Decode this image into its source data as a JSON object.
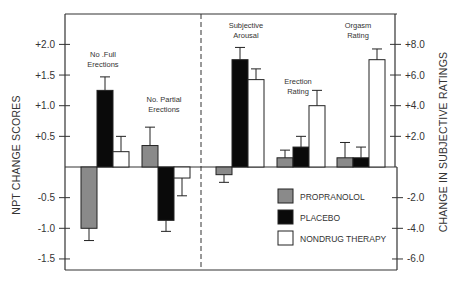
{
  "chart_data": {
    "type": "bar",
    "title": "",
    "left_axis": {
      "label": "NPT CHANGE SCORES",
      "ticks": [
        "+2.0",
        "+1.5",
        "+1.0",
        "+0.5",
        "-0.5",
        "-1.0",
        "-1.5"
      ],
      "tick_values": [
        2.0,
        1.5,
        1.0,
        0.5,
        -0.5,
        -1.0,
        -1.5
      ],
      "ylim": [
        -1.75,
        2.4
      ]
    },
    "right_axis": {
      "label": "CHANGE IN SUBJECTIVE RATINGS",
      "ticks": [
        "+8.0",
        "+6.0",
        "+4.0",
        "+2.0",
        "-2.0",
        "-4.0",
        "-6.0"
      ],
      "tick_values": [
        8.0,
        6.0,
        4.0,
        2.0,
        -2.0,
        -4.0,
        -6.0
      ],
      "ylim": [
        -7.0,
        9.6
      ]
    },
    "categories": [
      "No. Full Erections",
      "No. Partial Erections",
      "Subjective Arousal",
      "Erection Rating",
      "Orgasm Rating"
    ],
    "category_labels": [
      [
        "No .Full",
        "Erections"
      ],
      [
        "No. Partial",
        "Erections"
      ],
      [
        "Subjective",
        "Arousal"
      ],
      [
        "Erection",
        "Rating"
      ],
      [
        "Orgasm",
        "Rating"
      ]
    ],
    "category_axis": [
      "left",
      "left",
      "right",
      "right",
      "right"
    ],
    "series": [
      {
        "name": "PROPRANOLOL",
        "color": "#8a8a8a",
        "values": [
          -1.0,
          0.35,
          -0.5,
          0.6,
          0.6
        ],
        "errors": [
          -1.2,
          0.65,
          -1.0,
          1.1,
          1.6
        ]
      },
      {
        "name": "PLACEBO",
        "color": "#0a0a0a",
        "values": [
          1.25,
          -0.87,
          7.0,
          1.3,
          0.6
        ],
        "errors": [
          1.47,
          -1.05,
          7.8,
          2.0,
          1.3
        ]
      },
      {
        "name": "NONDRUG THERAPY",
        "color": "#ffffff",
        "values": [
          0.25,
          -0.18,
          5.7,
          4.0,
          7.0
        ],
        "errors": [
          0.5,
          -0.47,
          6.4,
          5.0,
          7.7
        ]
      }
    ],
    "legend": {
      "position": "lower-right-inside",
      "entries": [
        "PROPRANOLOL",
        "PLACEBO",
        "NONDRUG THERAPY"
      ]
    },
    "divider": "dashed vertical line separating NPT measures (left axis) from subjective ratings (right axis)",
    "grid": false
  }
}
